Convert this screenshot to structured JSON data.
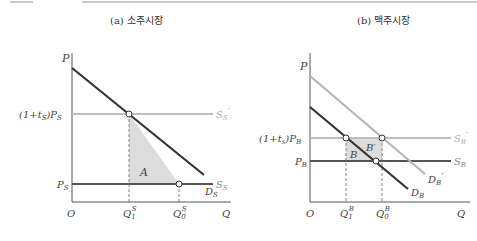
{
  "panels": {
    "a": {
      "title": "(a) 소주시장",
      "y_axis_label": "P",
      "x_axis_label": "Q",
      "origin_label": "O",
      "price_labels": {
        "taxed": "(1+t",
        "taxed_sub": "S",
        "taxed_tail": ")P",
        "taxed_tail_sub": "S",
        "base": "P",
        "base_sub": "S"
      },
      "curves": {
        "supply_taxed": {
          "label": "S",
          "sub": "S",
          "prime": "′",
          "color": "#bdbdbd"
        },
        "supply": {
          "label": "S",
          "sub": "S",
          "color": "#555555"
        },
        "demand": {
          "label": "D",
          "sub": "S",
          "color": "#333333"
        }
      },
      "area_label": "A",
      "q_labels": [
        {
          "base": "Q",
          "sub": "1",
          "sup": "S"
        },
        {
          "base": "Q",
          "sub": "0",
          "sup": "S"
        }
      ]
    },
    "b": {
      "title": "(b) 맥주시장",
      "y_axis_label": "P",
      "x_axis_label": "Q",
      "origin_label": "O",
      "price_labels": {
        "taxed": "(1+t",
        "taxed_sub": "s",
        "taxed_tail": ")P",
        "taxed_tail_sub": "B",
        "base": "P",
        "base_sub": "B"
      },
      "curves": {
        "supply_taxed": {
          "label": "S",
          "sub": "B",
          "prime": "′",
          "color": "#bdbdbd"
        },
        "supply": {
          "label": "S",
          "sub": "B",
          "color": "#555555"
        },
        "demand_shifted": {
          "label": "D",
          "sub": "B",
          "prime": "′",
          "color": "#b5b5b5"
        },
        "demand": {
          "label": "D",
          "sub": "B",
          "color": "#333333"
        }
      },
      "area_labels": [
        "B",
        "B′"
      ],
      "q_labels": [
        {
          "base": "Q",
          "sub": "1",
          "sup": "B"
        },
        {
          "base": "Q",
          "sub": "0",
          "sup": "B"
        }
      ]
    }
  },
  "colors": {
    "axis": "#555555",
    "area_fill": "#dcdcdc",
    "dashed": "#666666"
  }
}
